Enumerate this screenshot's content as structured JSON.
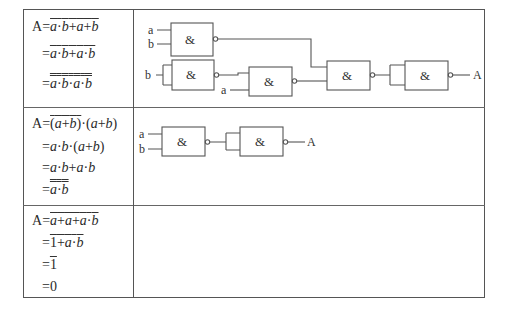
{
  "rows": [
    {
      "equations": [
        {
          "prefix": "A =",
          "expr": "a·b + (ā + b)̄",
          "display": "a·b+a+b"
        },
        {
          "prefix": "=",
          "expr": "(a·b + a·b̄)̄",
          "display": "a·b+a·b"
        },
        {
          "prefix": "=",
          "expr": "((a·b)̄ · (a·b̄)̄)̄",
          "display": "a·b·a·b"
        }
      ],
      "circuit": {
        "inputs": [
          "a",
          "b",
          "b",
          "a"
        ],
        "gate_symbol": "&",
        "output": "A"
      }
    },
    {
      "equations": [
        {
          "prefix": "A =",
          "expr": "(ā + b̄)̄ · (a + b)",
          "display": "(a+b)·(a+b)"
        },
        {
          "prefix": "=",
          "expr": "a·b·(a + b)",
          "display": "a·b·(a+b)"
        },
        {
          "prefix": "=",
          "expr": "a·b + a·b",
          "display": "a·b+a·b"
        },
        {
          "prefix": "=",
          "expr": "((a·b)̄)̄",
          "display": "a·b"
        }
      ],
      "circuit": {
        "inputs": [
          "a",
          "b"
        ],
        "gate_symbol": "&",
        "output": "A"
      }
    },
    {
      "equations": [
        {
          "prefix": "A =",
          "expr": "(a + ā + a·b)̄",
          "display": "a+a+a·b"
        },
        {
          "prefix": "=",
          "expr": "(1 + a·b)̄",
          "display": "1+a·b"
        },
        {
          "prefix": "=",
          "expr": "1̄",
          "display": "1"
        },
        {
          "prefix": "=",
          "expr": "0",
          "display": "0"
        }
      ]
    }
  ],
  "labels": {
    "A": "A",
    "eq": "=",
    "a": "a",
    "b": "b",
    "one": "1",
    "zero": "0",
    "and": "&",
    "dot": "·",
    "plus": "+",
    "lp": "(",
    "rp": ")"
  }
}
